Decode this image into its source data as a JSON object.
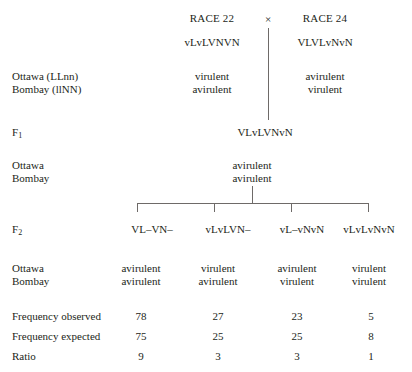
{
  "figure": {
    "cross_symbol": "×",
    "parents": [
      {
        "name": "RACE 22",
        "genotype": "vLvLVNVN",
        "phenotypes": [
          "virulent",
          "avirulent"
        ]
      },
      {
        "name": "RACE 24",
        "genotype": "VLVLvNvN",
        "phenotypes": [
          "avirulent",
          "virulent"
        ]
      }
    ],
    "host_labels_parents": [
      "Ottawa (LLnn)",
      "Bombay (llNN)"
    ],
    "host_labels_f1": [
      "Ottawa",
      "Bombay"
    ],
    "host_labels_f2": [
      "Ottawa",
      "Bombay"
    ],
    "generation_labels": {
      "f1": "F",
      "f1_sub": "1",
      "f2": "F",
      "f2_sub": "2"
    },
    "f1": {
      "genotype": "VLvLVNvN",
      "phenotypes": [
        "avirulent",
        "avirulent"
      ]
    },
    "f2": {
      "columns": [
        {
          "genotype": "VL–VN–",
          "phenotypes": [
            "avirulent",
            "avirulent"
          ],
          "frequency_observed": "78",
          "frequency_expected": "75",
          "ratio": "9"
        },
        {
          "genotype": "vLvLVN–",
          "phenotypes": [
            "virulent",
            "avirulent"
          ],
          "frequency_observed": "27",
          "frequency_expected": "25",
          "ratio": "3"
        },
        {
          "genotype": "vL–vNvN",
          "phenotypes": [
            "avirulent",
            "virulent"
          ],
          "frequency_observed": "23",
          "frequency_expected": "25",
          "ratio": "3"
        },
        {
          "genotype": "vLvLvNvN",
          "phenotypes": [
            "virulent",
            "virulent"
          ],
          "frequency_observed": "5",
          "frequency_expected": "8",
          "ratio": "1"
        }
      ]
    },
    "data_row_labels": {
      "frequency_observed": "Frequency observed",
      "frequency_expected": "Frequency expected",
      "ratio": "Ratio"
    },
    "colors": {
      "text": "#231f20",
      "line": "#6e6a68",
      "background": "#ffffff"
    }
  }
}
